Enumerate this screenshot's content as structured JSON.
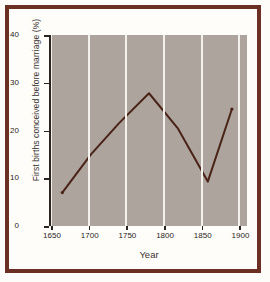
{
  "figure": {
    "border_color": "#6b2f23",
    "page_background": "#fefdfa",
    "plot_background": "#ada49d",
    "gridline_color": "#f4f1ec",
    "line_color": "#4a2318"
  },
  "chart_data": {
    "type": "line",
    "title": "",
    "xlabel": "Year",
    "ylabel": "First births conceived before marriage (%)",
    "xlim": [
      1650,
      1910
    ],
    "ylim": [
      0,
      40
    ],
    "xticks": [
      1650,
      1700,
      1750,
      1800,
      1850,
      1900
    ],
    "xtick_labels": [
      "1650",
      "1700",
      "1750",
      "1800",
      "1850",
      "1900"
    ],
    "yticks": [
      0,
      10,
      20,
      30,
      40
    ],
    "ytick_labels": [
      "0",
      "10",
      "20",
      "30",
      "40"
    ],
    "grid": "vertical",
    "legend": "none",
    "series": [
      {
        "name": "First births conceived before marriage",
        "x": [
          1665,
          1703,
          1740,
          1780,
          1818,
          1858,
          1890
        ],
        "values": [
          7.0,
          15.0,
          21.5,
          27.8,
          20.5,
          9.3,
          24.5
        ]
      }
    ]
  }
}
